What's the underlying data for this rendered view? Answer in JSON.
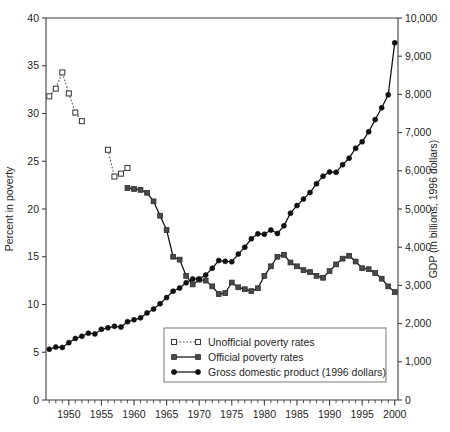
{
  "chart_data": {
    "type": "line",
    "title": "",
    "xlabel": "",
    "ylabel": "Percent in poverty",
    "y2label": "GDP (in billions, 1996 dollars)",
    "xlim": [
      1946.5,
      2000.5
    ],
    "ylim": [
      0,
      40
    ],
    "y2lim": [
      0,
      10000
    ],
    "grid": false,
    "legend_position": "bottom-center",
    "x_ticks_major": [
      1950,
      1955,
      1960,
      1965,
      1970,
      1975,
      1980,
      1985,
      1990,
      1995,
      2000
    ],
    "x_tick_labels": [
      "1950",
      "1955",
      "1960",
      "1965",
      "1970",
      "1975",
      "1980",
      "1985",
      "1990",
      "1995",
      "2000"
    ],
    "x_minor_tick_step": 1,
    "y_ticks": [
      0,
      5,
      10,
      15,
      20,
      25,
      30,
      35,
      40
    ],
    "y_tick_labels": [
      "0",
      "5",
      "10",
      "15",
      "20",
      "25",
      "30",
      "35",
      "40"
    ],
    "y2_ticks": [
      0,
      1000,
      2000,
      3000,
      4000,
      5000,
      6000,
      7000,
      8000,
      9000,
      10000
    ],
    "y2_tick_labels": [
      "0",
      "1,000",
      "2,000",
      "3,000",
      "4,000",
      "5,000",
      "6,000",
      "7,000",
      "8,000",
      "9,000",
      "10,000"
    ],
    "series": [
      {
        "name": "Unofficial poverty rates",
        "axis": "left",
        "marker": "open-square",
        "line": "dotted",
        "color": "#4a4a4a",
        "segments": [
          {
            "x": [
              1947,
              1948,
              1949,
              1950,
              1951,
              1952
            ],
            "values": [
              31.8,
              32.6,
              34.3,
              32.1,
              30.1,
              29.2
            ]
          },
          {
            "x": [
              1956,
              1957,
              1958,
              1959
            ],
            "values": [
              26.2,
              23.4,
              23.7,
              24.3
            ]
          }
        ]
      },
      {
        "name": "Official poverty rates",
        "axis": "left",
        "marker": "filled-square",
        "line": "solid",
        "color": "#4a4a4a",
        "x": [
          1959,
          1960,
          1961,
          1962,
          1963,
          1964,
          1965,
          1966,
          1967,
          1968,
          1969,
          1970,
          1971,
          1972,
          1973,
          1974,
          1975,
          1976,
          1977,
          1978,
          1979,
          1980,
          1981,
          1982,
          1983,
          1984,
          1985,
          1986,
          1987,
          1988,
          1989,
          1990,
          1991,
          1992,
          1993,
          1994,
          1995,
          1996,
          1997,
          1998,
          1999,
          2000
        ],
        "values": [
          22.2,
          22.1,
          22.0,
          21.7,
          20.8,
          19.3,
          17.8,
          15.0,
          14.7,
          13.0,
          12.1,
          12.6,
          12.5,
          11.9,
          11.1,
          11.2,
          12.3,
          11.8,
          11.6,
          11.4,
          11.7,
          13.0,
          14.0,
          15.0,
          15.2,
          14.4,
          14.0,
          13.6,
          13.4,
          13.0,
          12.8,
          13.5,
          14.2,
          14.8,
          15.1,
          14.5,
          13.8,
          13.7,
          13.3,
          12.7,
          11.9,
          11.3
        ]
      },
      {
        "name": "Gross domestic product (1996 dollars)",
        "axis": "right",
        "marker": "filled-circle",
        "line": "solid",
        "color": "#111111",
        "x": [
          1947,
          1948,
          1949,
          1950,
          1951,
          1952,
          1953,
          1954,
          1955,
          1956,
          1957,
          1958,
          1959,
          1960,
          1961,
          1962,
          1963,
          1964,
          1965,
          1966,
          1967,
          1968,
          1969,
          1970,
          1971,
          1972,
          1973,
          1974,
          1975,
          1976,
          1977,
          1978,
          1979,
          1980,
          1981,
          1982,
          1983,
          1984,
          1985,
          1986,
          1987,
          1988,
          1989,
          1990,
          1991,
          1992,
          1993,
          1994,
          1995,
          1996,
          1997,
          1998,
          1999,
          2000
        ],
        "values": [
          1330,
          1385,
          1375,
          1500,
          1610,
          1670,
          1750,
          1730,
          1850,
          1890,
          1930,
          1910,
          2050,
          2100,
          2150,
          2280,
          2380,
          2520,
          2680,
          2850,
          2930,
          3070,
          3170,
          3170,
          3270,
          3450,
          3650,
          3630,
          3620,
          3820,
          4000,
          4220,
          4350,
          4340,
          4450,
          4360,
          4560,
          4890,
          5090,
          5260,
          5430,
          5660,
          5860,
          5970,
          5960,
          6160,
          6330,
          6590,
          6760,
          7020,
          7340,
          7650,
          7990,
          9350
        ]
      }
    ]
  },
  "legend": {
    "entries": [
      {
        "label": "Unofficial poverty rates"
      },
      {
        "label": "Official poverty rates"
      },
      {
        "label": "Gross domestic product (1996 dollars)"
      }
    ]
  }
}
